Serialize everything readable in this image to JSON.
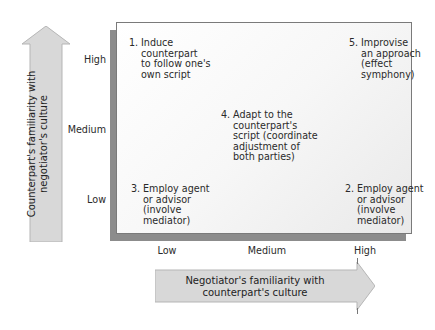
{
  "diagram": {
    "y_axis": {
      "label_line1": "Counterpart's familiarity with",
      "label_line2": "negotiator's culture",
      "ticks": [
        "High",
        "Medium",
        "Low"
      ]
    },
    "x_axis": {
      "label_line1": "Negotiator's familiarity with",
      "label_line2": "counterpart's culture",
      "ticks": [
        "Low",
        "Medium",
        "High"
      ]
    },
    "items": [
      {
        "number": "1.",
        "text": "Induce\ncounterpart\nto follow one's\nown script",
        "position": "high-low"
      },
      {
        "number": "2.",
        "text": "Employ agent\nor advisor\n(involve\nmediator)",
        "position": "low-high"
      },
      {
        "number": "3.",
        "text": "Employ agent\nor advisor\n(involve\nmediator)",
        "position": "low-low"
      },
      {
        "number": "4.",
        "text": "Adapt to the\ncounterpart's\nscript (coordinate\nadjustment of\nboth parties)",
        "position": "medium-medium"
      },
      {
        "number": "5.",
        "text": "Improvise\nan approach\n(effect\nsymphony)",
        "position": "high-high"
      }
    ],
    "colors": {
      "arrow_fill": "#d8d8d8",
      "arrow_edge": "#b5b5b5",
      "shadow": "#8c8c8c",
      "panel_border": "#7a7a7a"
    }
  }
}
